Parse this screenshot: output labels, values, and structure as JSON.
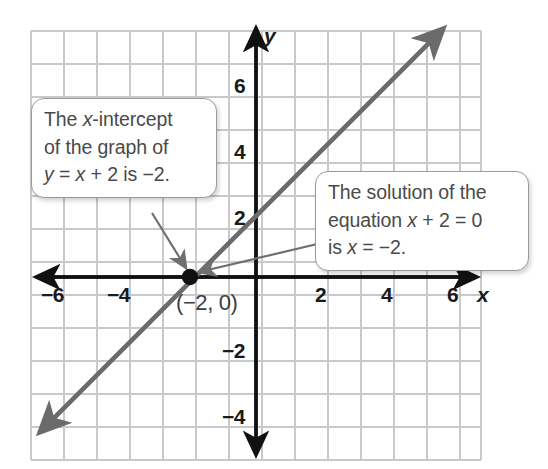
{
  "figure": {
    "background_color": "#ffffff"
  },
  "chart_data": {
    "type": "line",
    "title": "",
    "xlabel": "x",
    "ylabel": "y",
    "xlim": [
      -7.6,
      6.8
    ],
    "ylim": [
      -5.6,
      7.4
    ],
    "grid": true,
    "grid_step": 1,
    "legend": "none",
    "x_ticks": [
      -6,
      -4,
      2,
      4,
      6
    ],
    "x_tick_labels": [
      "−6",
      "−4",
      "2",
      "4",
      "6"
    ],
    "y_ticks": [
      6,
      4,
      2,
      -2,
      -4
    ],
    "y_tick_labels": [
      "6",
      "4",
      "2",
      "−2",
      "−4"
    ],
    "series": [
      {
        "name": "y = x + 2",
        "equation": "y = x + 2",
        "slope": 1,
        "intercept": 2,
        "color": "#6b6b6b",
        "line_width": 4,
        "arrows": "both",
        "x_range": [
          -7.2,
          6.0
        ],
        "points": [
          {
            "x": -7.2,
            "y": -5.2
          },
          {
            "x": 6.0,
            "y": 8.0
          }
        ]
      }
    ],
    "annotations": [
      {
        "name": "x-intercept-point",
        "x": -2,
        "y": 0,
        "label": "(−2, 0)",
        "marker": "filled-circle",
        "color": "#111111"
      }
    ]
  },
  "callouts": [
    {
      "id": "x-intercept-callout",
      "lines": [
        {
          "parts": [
            {
              "t": "The ",
              "italic": false
            },
            {
              "t": "x",
              "italic": true
            },
            {
              "t": "-intercept",
              "italic": false
            }
          ]
        },
        {
          "parts": [
            {
              "t": "of the graph of",
              "italic": false
            }
          ]
        },
        {
          "parts": [
            {
              "t": "y",
              "italic": true
            },
            {
              "t": " = ",
              "italic": false
            },
            {
              "t": "x",
              "italic": true
            },
            {
              "t": " + 2 is −2.",
              "italic": false
            }
          ]
        }
      ],
      "text": "The x-intercept of the graph of y = x + 2 is −2."
    },
    {
      "id": "solution-callout",
      "lines": [
        {
          "parts": [
            {
              "t": "The solution of the",
              "italic": false
            }
          ]
        },
        {
          "parts": [
            {
              "t": "equation ",
              "italic": false
            },
            {
              "t": "x",
              "italic": true
            },
            {
              "t": " + 2 = 0",
              "italic": false
            }
          ]
        },
        {
          "parts": [
            {
              "t": "is ",
              "italic": false
            },
            {
              "t": "x",
              "italic": true
            },
            {
              "t": " = −2.",
              "italic": false
            }
          ]
        }
      ],
      "text": "The solution of the equation x + 2 = 0 is x = −2."
    }
  ],
  "labels": {
    "x_axis_name": "x",
    "y_axis_name": "y",
    "point_label": "(−2, 0)",
    "x_tick_neg6": "−6",
    "x_tick_neg4": "−4",
    "x_tick_2": "2",
    "x_tick_4": "4",
    "x_tick_6": "6",
    "y_tick_6": "6",
    "y_tick_4": "4",
    "y_tick_2": "2",
    "y_tick_neg2": "−2",
    "y_tick_neg4": "−4"
  },
  "colors": {
    "grid": "#c9c9c9",
    "axis": "#111111",
    "line": "#6b6b6b",
    "callout_border": "#9a9a9a",
    "callout_text": "#4a4a4a",
    "pointer_arrow": "#6f6f6f"
  }
}
